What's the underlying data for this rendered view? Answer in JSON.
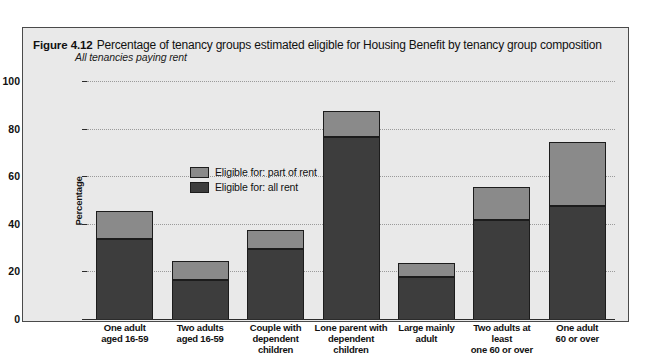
{
  "figure": {
    "number": "Figure 4.12",
    "title": "Percentage of tenancy groups estimated eligible for Housing Benefit by tenancy group composition",
    "subtitle": "All tenancies paying rent"
  },
  "legend": {
    "items": [
      {
        "label": "Eligible for: part of rent",
        "color": "#8a8a8a",
        "key": "part"
      },
      {
        "label": "Eligible for: all rent",
        "color": "#3d3d3d",
        "key": "all"
      }
    ]
  },
  "axes": {
    "ylabel": "Percentage",
    "yticks": [
      "0",
      "20",
      "40",
      "60",
      "80",
      "100"
    ]
  },
  "chart_data": {
    "type": "bar",
    "title": "Percentage of tenancy groups estimated eligible for Housing Benefit by tenancy group composition",
    "subtitle": "All tenancies paying rent",
    "xlabel": "",
    "ylabel": "Percentage",
    "ylim": [
      0,
      100
    ],
    "yticks": [
      0,
      20,
      40,
      60,
      80,
      100
    ],
    "grid": true,
    "stacked": true,
    "legend_position": "inside-top-left",
    "categories": [
      "One adult aged 16-59",
      "Two adults aged 16-59",
      "Couple with dependent children",
      "Lone parent with dependent children",
      "Large mainly adult",
      "Two adults at least one 60 or over",
      "One adult 60 or over"
    ],
    "category_lines": [
      [
        "One adult",
        "aged 16-59"
      ],
      [
        "Two adults",
        "aged 16-59"
      ],
      [
        "Couple with",
        "dependent children"
      ],
      [
        "Lone parent with",
        "dependent children"
      ],
      [
        "Large mainly",
        "adult"
      ],
      [
        "Two adults at least",
        "one 60 or over"
      ],
      [
        "One adult",
        "60 or over"
      ]
    ],
    "series": [
      {
        "name": "Eligible for: all rent",
        "color": "#3d3d3d",
        "values": [
          34,
          17,
          30,
          77,
          18,
          42,
          48
        ]
      },
      {
        "name": "Eligible for: part of rent",
        "color": "#8a8a8a",
        "values": [
          12,
          8,
          8,
          11,
          6,
          14,
          27
        ]
      }
    ],
    "totals": [
      46,
      25,
      38,
      88,
      24,
      56,
      75
    ]
  }
}
